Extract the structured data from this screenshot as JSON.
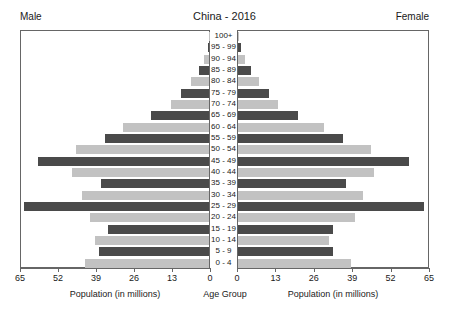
{
  "header": {
    "male_label": "Male",
    "female_label": "Female",
    "title": "China - 2016"
  },
  "axis": {
    "left_title": "Population (in millions)",
    "center_title": "Age Group",
    "right_title": "Population (in millions)",
    "ticks_left": [
      "65",
      "52",
      "39",
      "26",
      "13",
      "0"
    ],
    "ticks_right": [
      "0",
      "13",
      "26",
      "39",
      "52",
      "65"
    ]
  },
  "colors": {
    "bar_dark": "#4a4a4a",
    "bar_light": "#c2c2c2",
    "axis": "#666666",
    "background": "#ffffff",
    "text": "#1a1a1a"
  },
  "chart_data": {
    "type": "bar",
    "subtype": "population-pyramid",
    "title": "China - 2016",
    "xlabel": "Population (in millions)",
    "ylabel": "Age Group",
    "xlim": [
      0,
      65
    ],
    "xticks": [
      0,
      13,
      26,
      39,
      52,
      65
    ],
    "grid": false,
    "legend": [
      "Male",
      "Female"
    ],
    "legend_position": "top-left and top-right",
    "categories": [
      "100+",
      "95 - 99",
      "90 - 94",
      "85 - 89",
      "80 - 84",
      "75 - 79",
      "70 - 74",
      "65 - 69",
      "60 - 64",
      "55 - 59",
      "50 - 54",
      "45 - 49",
      "40 - 44",
      "35 - 39",
      "30 - 34",
      "25 - 29",
      "20 - 24",
      "15 - 19",
      "10 - 14",
      "5 - 9",
      "0 - 4"
    ],
    "series": [
      {
        "name": "Male",
        "side": "left",
        "values": [
          0.1,
          0.5,
          1.6,
          3.4,
          6.2,
          9.6,
          13.3,
          20.0,
          29.7,
          36.0,
          45.9,
          59.0,
          47.5,
          37.5,
          43.8,
          63.8,
          41.0,
          35.0,
          39.5,
          38.0,
          43.0
        ]
      },
      {
        "name": "Female",
        "side": "right",
        "values": [
          0.2,
          0.9,
          2.4,
          4.4,
          7.2,
          10.6,
          13.8,
          20.4,
          29.5,
          36.0,
          45.6,
          58.5,
          46.5,
          37.0,
          42.6,
          63.5,
          40.0,
          32.5,
          31.0,
          32.5,
          38.5
        ]
      }
    ],
    "bar_shading": "alternating dark/light gray by age band"
  }
}
